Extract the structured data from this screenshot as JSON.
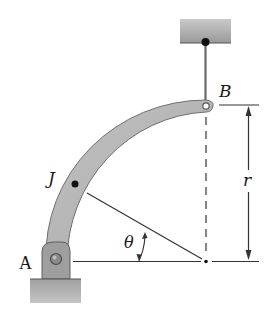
{
  "figure": {
    "type": "mechanics diagram",
    "labels": {
      "point_a": "A",
      "point_b": "B",
      "point_j": "J",
      "angle": "θ",
      "radius": "r"
    },
    "colors": {
      "bar_fill": "#b3b3b3",
      "bar_edge": "#6e6e6e",
      "support_fill": "#a9a9a9",
      "line": "#333333",
      "background": "#ffffff"
    }
  }
}
